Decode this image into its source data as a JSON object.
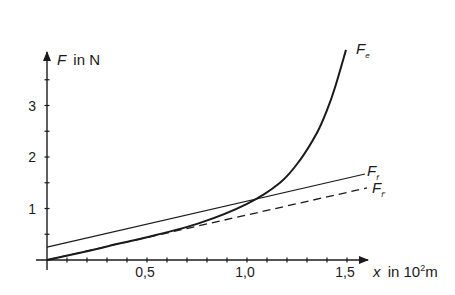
{
  "chart_data": {
    "type": "line",
    "title": "",
    "xlabel": "x in 10²m",
    "ylabel": "F in N",
    "xlim": [
      0,
      1.6
    ],
    "ylim": [
      0,
      4.1
    ],
    "grid": false,
    "legend_position": "inline labels at line ends",
    "x_ticks": [
      0.1,
      0.2,
      0.3,
      0.4,
      0.5,
      0.6,
      0.7,
      0.8,
      0.9,
      1.0,
      1.1,
      1.2,
      1.3,
      1.4,
      1.5
    ],
    "x_tick_labels": [
      {
        "value": 0.5,
        "label": "0,5"
      },
      {
        "value": 1.0,
        "label": "1,0"
      },
      {
        "value": 1.5,
        "label": "1,5"
      }
    ],
    "y_ticks": [
      0.5,
      1,
      1.5,
      2,
      2.5,
      3,
      3.5
    ],
    "y_tick_labels": [
      {
        "value": 1,
        "label": "1"
      },
      {
        "value": 2,
        "label": "2"
      },
      {
        "value": 3,
        "label": "3"
      }
    ],
    "series": [
      {
        "name": "F_e",
        "label_main": "F",
        "label_sub": "e",
        "style": "solid-thick",
        "x": [
          0,
          0.2,
          0.35,
          0.5,
          0.765,
          1.0,
          1.165,
          1.265,
          1.35,
          1.4,
          1.44,
          1.495
        ],
        "values": [
          0,
          0.17,
          0.31,
          0.44,
          0.72,
          1.09,
          1.5,
          1.94,
          2.47,
          2.91,
          3.35,
          4.08
        ]
      },
      {
        "name": "F_f",
        "label_main": "F",
        "label_sub": "f",
        "style": "solid-thin",
        "x": [
          0,
          1.59
        ],
        "values": [
          0.25,
          1.67
        ]
      },
      {
        "name": "F_f'",
        "label_main": "F",
        "label_sub": "f'",
        "style": "dashed",
        "x": [
          0,
          1.6
        ],
        "values": [
          0,
          1.4
        ]
      }
    ]
  },
  "axes": {
    "y_label_main": "F",
    "y_label_unit": "in N",
    "x_label_var": "x",
    "x_label_unit": "in 10",
    "x_label_exp": "2",
    "x_label_m": "m"
  },
  "colors": {
    "ink": "#1a1a1a",
    "background": "#ffffff"
  }
}
